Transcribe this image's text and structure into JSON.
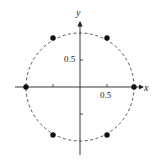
{
  "diagram": {
    "title": "",
    "axes": {
      "x_label": "x",
      "y_label": "y",
      "x_tick_label": "0.5",
      "y_tick_label": "0.5"
    },
    "circle": {
      "center": [
        0,
        0
      ],
      "radius": 1,
      "style": "dashed"
    },
    "points": [
      {
        "x": 1,
        "y": 0
      },
      {
        "x": 0.5,
        "y": 0.866
      },
      {
        "x": -0.5,
        "y": 0.866
      },
      {
        "x": -1,
        "y": 0
      },
      {
        "x": -0.5,
        "y": -0.866
      },
      {
        "x": 0.5,
        "y": -0.866
      }
    ],
    "colors": {
      "ink": "#222222",
      "background": "#ffffff"
    }
  }
}
